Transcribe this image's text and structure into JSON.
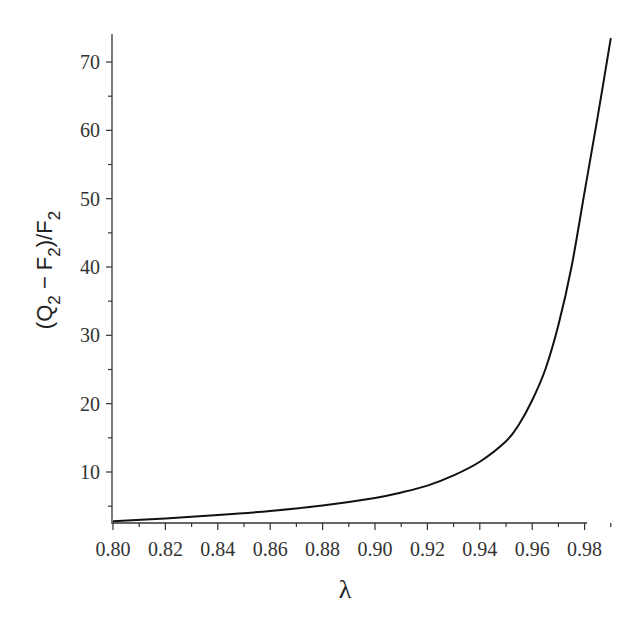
{
  "chart_data": {
    "type": "line",
    "title": "",
    "xlabel": "λ",
    "ylabel": "(Q2 − F2)/F2",
    "ylabel_parts": {
      "open": "(Q",
      "sub1": "2",
      "minus": " − F",
      "sub2": "2",
      "close": ")/F",
      "sub3": "2"
    },
    "xlim": [
      0.8,
      0.991
    ],
    "ylim": [
      2.5,
      74
    ],
    "grid": false,
    "legend": null,
    "x_ticks": [
      "0.80",
      "0.82",
      "0.84",
      "0.86",
      "0.88",
      "0.90",
      "0.92",
      "0.94",
      "0.96",
      "0.98"
    ],
    "y_ticks": [
      "10",
      "20",
      "30",
      "40",
      "50",
      "60",
      "70"
    ],
    "series": [
      {
        "name": "(Q2 − F2)/F2",
        "color": "#111111",
        "x": [
          0.8,
          0.82,
          0.84,
          0.86,
          0.88,
          0.9,
          0.91,
          0.92,
          0.93,
          0.94,
          0.95,
          0.955,
          0.96,
          0.965,
          0.97,
          0.975,
          0.98,
          0.985,
          0.99
        ],
        "y": [
          2.8,
          3.2,
          3.7,
          4.3,
          5.1,
          6.2,
          7.0,
          8.0,
          9.5,
          11.5,
          14.5,
          17.0,
          20.5,
          25.0,
          31.5,
          40.0,
          51.0,
          62.0,
          73.5
        ]
      }
    ]
  }
}
